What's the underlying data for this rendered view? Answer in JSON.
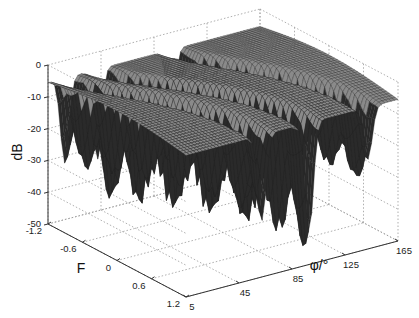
{
  "chart_data": {
    "type": "surface3d",
    "title": "",
    "xlabel": "φ/°",
    "ylabel": "F",
    "zlabel": "dB",
    "x_ticks": [
      "5",
      "45",
      "85",
      "125",
      "165"
    ],
    "y_ticks": [
      "-1.2",
      "-0.6",
      "0",
      "0.6",
      "1.2"
    ],
    "z_ticks": [
      "0",
      "-10",
      "-20",
      "-30",
      "-40",
      "-50"
    ],
    "xlim": [
      5,
      165
    ],
    "ylim": [
      -1.2,
      1.2
    ],
    "zlim": [
      -50,
      0
    ],
    "grid": true,
    "surface_description": "Mesh surface near 0 dB with sharp nulls (valleys) along curved ridges; deepest null about -43 dB near phi≈60, F≈0",
    "null_ridges": [
      {
        "phi_center": 40,
        "depth_db": -30
      },
      {
        "phi_center": 70,
        "depth_db": -43
      },
      {
        "phi_center": 120,
        "depth_db": -28
      }
    ],
    "base_level_db": -3
  }
}
